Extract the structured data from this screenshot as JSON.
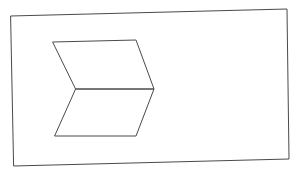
{
  "canvas": {
    "width": 298,
    "height": 173,
    "background": "#ffffff"
  },
  "style": {
    "stroke_color": "#4a4a4a",
    "frame_stroke_width": 1,
    "shape_stroke_width": 1
  },
  "frame": {
    "label": "",
    "points": "11,16 287,9 289,159 14,166"
  },
  "chevron": {
    "upper_parallelogram": {
      "points": "53,42 136,40 154,89 76,89"
    },
    "lower_parallelogram": {
      "points": "76,89 154,89 136,136 55,136"
    }
  }
}
